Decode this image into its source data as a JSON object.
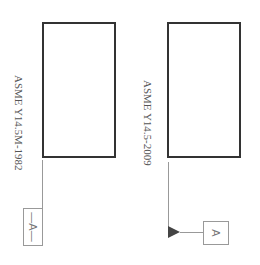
{
  "diagram": {
    "left": {
      "standard_label": "ASME Y14.5M-1982",
      "datum_label": "—A—",
      "datum_letter": "A"
    },
    "right": {
      "standard_label": "ASME Y14.5-2009",
      "datum_label": "A",
      "datum_letter": "A"
    }
  },
  "colors": {
    "part_outline": "#333333",
    "leader_line": "#999999",
    "datum_box": "#999999",
    "datum_triangle": "#444444",
    "text": "#555555"
  }
}
